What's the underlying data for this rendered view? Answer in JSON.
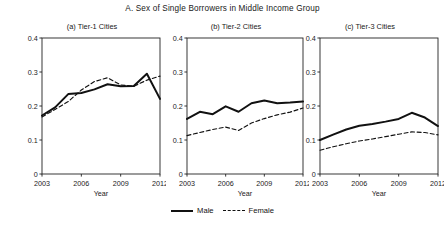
{
  "chart_data": {
    "type": "line",
    "title": "A. Sex of Single Borrowers in Middle Income Group",
    "xlabel": "Year",
    "ylabel": "",
    "xlim": [
      2003,
      2012
    ],
    "ylim": [
      0,
      0.4
    ],
    "xticks": [
      2003,
      2006,
      2009,
      2012
    ],
    "xticklabels": [
      "2003",
      "2006",
      "2009",
      "2012"
    ],
    "yticks": [
      0,
      0.1,
      0.2,
      0.3,
      0.4
    ],
    "yticklabels": [
      "0",
      "0.1",
      "0.2",
      "0.3",
      "0.4"
    ],
    "grid": false,
    "legend_position": "bottom-center",
    "legend": [
      "Male",
      "Female"
    ],
    "x": [
      2003,
      2004,
      2005,
      2006,
      2007,
      2008,
      2009,
      2010,
      2011,
      2012
    ],
    "panels": [
      {
        "key": "a",
        "title": "(a) Tier-1 Cities",
        "series": [
          {
            "name": "Male",
            "style": "solid",
            "values": [
              0.172,
              0.196,
              0.235,
              0.238,
              0.249,
              0.264,
              0.258,
              0.259,
              0.295,
              0.221
            ]
          },
          {
            "name": "Female",
            "style": "dashed",
            "values": [
              0.168,
              0.19,
              0.213,
              0.247,
              0.272,
              0.283,
              0.262,
              0.258,
              0.276,
              0.288
            ]
          }
        ]
      },
      {
        "key": "b",
        "title": "(b) Tier-2 Cities",
        "series": [
          {
            "name": "Male",
            "style": "solid",
            "values": [
              0.162,
              0.183,
              0.176,
              0.199,
              0.183,
              0.208,
              0.216,
              0.208,
              0.21,
              0.213
            ]
          },
          {
            "name": "Female",
            "style": "dashed",
            "values": [
              0.113,
              0.122,
              0.131,
              0.138,
              0.128,
              0.15,
              0.163,
              0.174,
              0.182,
              0.194
            ]
          }
        ]
      },
      {
        "key": "c",
        "title": "(c) Tier-3 Cities",
        "series": [
          {
            "name": "Male",
            "style": "solid",
            "values": [
              0.1,
              0.116,
              0.131,
              0.142,
              0.147,
              0.154,
              0.162,
              0.18,
              0.166,
              0.141
            ]
          },
          {
            "name": "Female",
            "style": "dashed",
            "values": [
              0.07,
              0.08,
              0.089,
              0.097,
              0.103,
              0.11,
              0.117,
              0.124,
              0.122,
              0.115
            ]
          }
        ]
      }
    ]
  },
  "legend": {
    "male_label": "Male",
    "female_label": "Female"
  },
  "colors": {
    "line": "#111111",
    "axis": "#222222",
    "background": "#ffffff"
  }
}
